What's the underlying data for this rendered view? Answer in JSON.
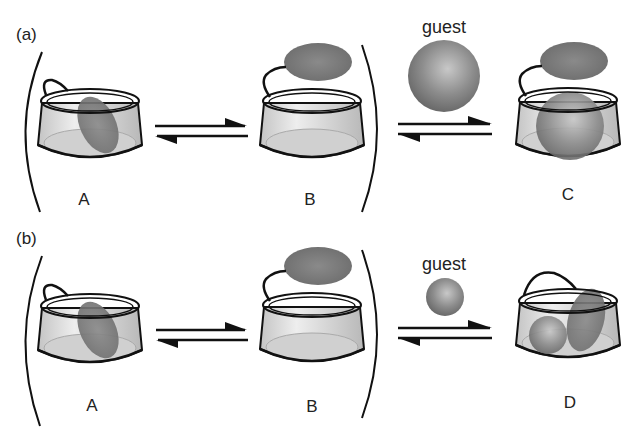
{
  "panels": [
    {
      "id": "a",
      "label": "(a)",
      "states": [
        {
          "label": "A",
          "description": "lid closed inside cup"
        },
        {
          "label": "B",
          "description": "lid open above cup"
        },
        {
          "label": "C",
          "description": "large guest inside cup, lid open"
        }
      ],
      "guest": {
        "label": "guest",
        "size": "large"
      }
    },
    {
      "id": "b",
      "label": "(b)",
      "states": [
        {
          "label": "A",
          "description": "lid closed inside cup"
        },
        {
          "label": "B",
          "description": "lid open above cup"
        },
        {
          "label": "D",
          "description": "small guest inside cup, lid closed"
        }
      ],
      "guest": {
        "label": "guest",
        "size": "small"
      }
    }
  ],
  "colors": {
    "outline": "#111111",
    "cup_fill": "#d4d4d4",
    "lid_fill": "#7a7a7a",
    "guest_fill": "#8a8a8a"
  }
}
